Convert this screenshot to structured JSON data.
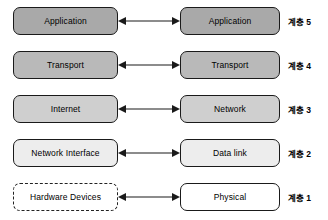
{
  "diagram": {
    "colors": {
      "arrow": "#1a1a1a",
      "box_border": "#1a1a1a",
      "text": "#000000",
      "background": "#ffffff"
    },
    "arrow_icon": "double-headed-arrow",
    "rows": [
      {
        "layer_label": "계층 5",
        "left": {
          "label": "Application",
          "fill": "#a9a9a9",
          "border_style": "solid"
        },
        "right": {
          "label": "Application",
          "fill": "#a9a9a9",
          "border_style": "solid"
        }
      },
      {
        "layer_label": "계층 4",
        "left": {
          "label": "Transport",
          "fill": "#b9b9b9",
          "border_style": "solid"
        },
        "right": {
          "label": "Transport",
          "fill": "#b9b9b9",
          "border_style": "solid"
        }
      },
      {
        "layer_label": "계층 3",
        "left": {
          "label": "Internet",
          "fill": "#cfcfcf",
          "border_style": "solid"
        },
        "right": {
          "label": "Network",
          "fill": "#cfcfcf",
          "border_style": "solid"
        }
      },
      {
        "layer_label": "계층 2",
        "left": {
          "label": "Network Interface",
          "fill": "#ededed",
          "border_style": "solid"
        },
        "right": {
          "label": "Data link",
          "fill": "#ededed",
          "border_style": "solid"
        }
      },
      {
        "layer_label": "계층 1",
        "left": {
          "label": "Hardware Devices",
          "fill": "#ffffff",
          "border_style": "dashed"
        },
        "right": {
          "label": "Physical",
          "fill": "#ffffff",
          "border_style": "solid"
        }
      }
    ]
  }
}
